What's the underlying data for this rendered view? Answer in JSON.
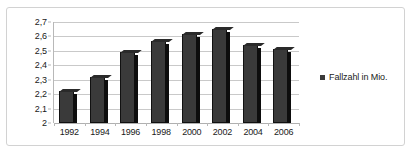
{
  "chart_data": {
    "type": "bar",
    "title": "",
    "subtitle": "",
    "xlabel": "",
    "ylabel": "",
    "categories": [
      "1992",
      "1994",
      "1996",
      "1998",
      "2000",
      "2002",
      "2004",
      "2006"
    ],
    "values": [
      2.22,
      2.32,
      2.49,
      2.57,
      2.62,
      2.65,
      2.54,
      2.51
    ],
    "series": [
      {
        "name": "Fallzahl in Mio.",
        "values": [
          2.22,
          2.32,
          2.49,
          2.57,
          2.62,
          2.65,
          2.54,
          2.51
        ]
      }
    ],
    "ylim": [
      2.0,
      2.7
    ],
    "ytick_labels": [
      "2,7",
      "2,6",
      "2,5",
      "2,4",
      "2,3",
      "2,2",
      "2,1",
      "2"
    ],
    "ytick_values": [
      2.7,
      2.6,
      2.5,
      2.4,
      2.3,
      2.2,
      2.1,
      2.0
    ],
    "grid": true,
    "legend_position": "right",
    "decimal_separator": ",",
    "bar_color": "#3a3a3a",
    "bar_side_color": "#0d0d0d",
    "gridline_color": "#c9c9c9",
    "border_color": "#d2d2d2"
  },
  "legend": {
    "entries": [
      {
        "label": "Fallzahl in Mio.",
        "marker": "square-marker-icon",
        "color": "#3a3a3a"
      }
    ]
  }
}
